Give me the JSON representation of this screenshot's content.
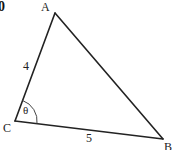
{
  "figure": {
    "question_number_fragment": "0",
    "vertices": {
      "A": {
        "label": "A",
        "x": 55,
        "y": 13
      },
      "B": {
        "label": "B",
        "x": 163,
        "y": 139
      },
      "C": {
        "label": "C",
        "x": 15,
        "y": 121
      }
    },
    "sides": {
      "CA": {
        "label": "4"
      },
      "CB": {
        "label": "5"
      }
    },
    "angle": {
      "vertex": "C",
      "label": "θ"
    },
    "colors": {
      "stroke": "#222222",
      "background": "#ffffff"
    }
  }
}
